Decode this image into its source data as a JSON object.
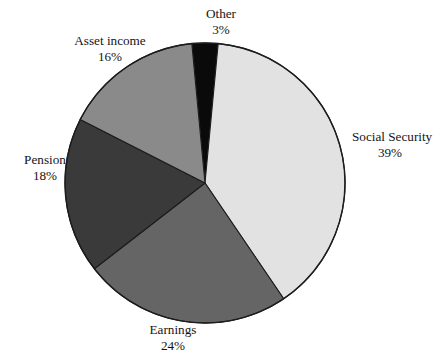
{
  "title": {
    "text": ""
  },
  "chart_data": {
    "type": "pie",
    "title": "",
    "subtitle": "",
    "xlabel": "",
    "ylabel": "",
    "legend_position": "none",
    "grid": false,
    "value_unit": "percent",
    "start_angle_deg": -5.4,
    "direction": "clockwise",
    "categories": [
      "Other",
      "Social Security",
      "Earnings",
      "Pension",
      "Asset income"
    ],
    "values": [
      3,
      39,
      24,
      18,
      16
    ],
    "slices": [
      {
        "name": "Other",
        "label": "Other",
        "value": 3,
        "value_label": "3%",
        "color": "#0a0a0a",
        "label_position": "top"
      },
      {
        "name": "Social Security",
        "label": "Social Security",
        "value": 39,
        "value_label": "39%",
        "color": "#e2e2e2",
        "label_position": "right"
      },
      {
        "name": "Earnings",
        "label": "Earnings",
        "value": 24,
        "value_label": "24%",
        "color": "#656565",
        "label_position": "bottom"
      },
      {
        "name": "Pension",
        "label": "Pension",
        "value": 18,
        "value_label": "18%",
        "color": "#3a3a3a",
        "label_position": "left"
      },
      {
        "name": "Asset income",
        "label": "Asset income",
        "value": 16,
        "value_label": "16%",
        "color": "#8a8a8a",
        "label_position": "top-left"
      }
    ]
  },
  "geometry": {
    "center_x": 205,
    "center_y": 183,
    "radius": 140,
    "outline_color": "#1c1c1c"
  }
}
